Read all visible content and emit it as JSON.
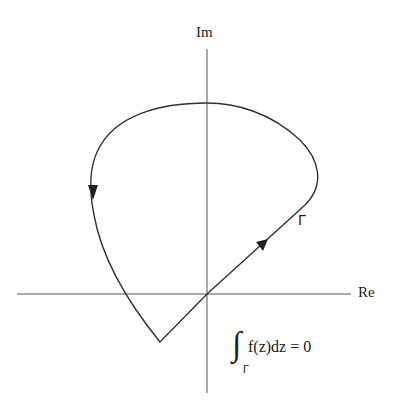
{
  "diagram": {
    "axes": {
      "imaginary_label": "Im",
      "real_label": "Re"
    },
    "contour": {
      "label": "Γ",
      "direction": "counterclockwise",
      "shape": "closed loop with a corner (vertex) below the real axis"
    },
    "equation": {
      "integral_symbol": "∫",
      "subscript": "Γ",
      "expression": "f(z)dz = 0"
    },
    "colors": {
      "stroke": "#333333",
      "background": "#ffffff"
    }
  }
}
